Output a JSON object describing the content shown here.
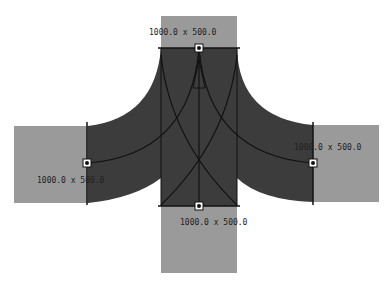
{
  "diagram": {
    "type": "road-intersection-layout",
    "colors": {
      "background": "#ffffff",
      "approach_road": "#9a9a9a",
      "junction_area": "#3c3c3c",
      "lines": "#111111",
      "handle_fill": "#ffffff",
      "handle_stroke": "#111111"
    },
    "roads": [
      {
        "id": "north",
        "label": "1000.0 x 500.0"
      },
      {
        "id": "west",
        "label": "1000.0 x 500.0"
      },
      {
        "id": "east",
        "label": "1000.0 x 500.0"
      },
      {
        "id": "south",
        "label": "1000.0 x 500.0"
      }
    ]
  }
}
